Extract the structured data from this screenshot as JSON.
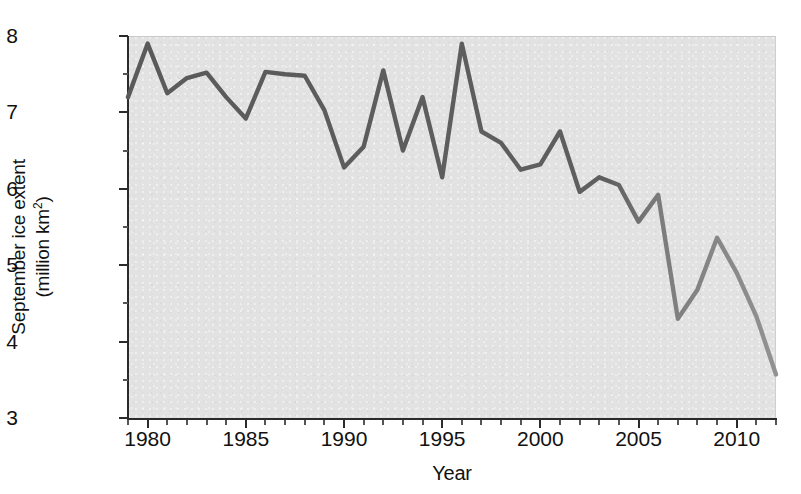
{
  "figure": {
    "background_color": "#ffffff",
    "plot_background_color": "#e2e2e2",
    "axis_color": "#2b2b2b",
    "text_color": "#111111"
  },
  "axes": {
    "y_title_line1": "September ice extent",
    "y_title_line2_prefix": "(million km",
    "y_title_line2_sup": "2",
    "y_title_line2_suffix": ")",
    "x_title": "Year",
    "y_tick_labels": [
      "8",
      "7",
      "6",
      "5",
      "4",
      "3"
    ],
    "y_tick_values": [
      8,
      7,
      6,
      5,
      4,
      3
    ],
    "y_minor_step": 0.5,
    "x_tick_labels": [
      "1980",
      "1985",
      "1990",
      "1995",
      "2000",
      "2005",
      "2010"
    ],
    "x_tick_values": [
      1980,
      1985,
      1990,
      1995,
      2000,
      2005,
      2010
    ],
    "x_minor_step": 1
  },
  "chart_data": {
    "type": "line",
    "title": "",
    "subtitle": "",
    "xlabel": "Year",
    "ylabel": "September ice extent (million km2)",
    "xlim": [
      1979,
      2012
    ],
    "ylim": [
      3,
      8
    ],
    "grid": false,
    "legend": "none",
    "line_color_early": "#5a5a5a",
    "line_color_late": "#8c8c8c",
    "line_width": 4,
    "series": [
      {
        "name": "September Arctic sea ice extent",
        "x": [
          1979,
          1980,
          1981,
          1982,
          1983,
          1984,
          1985,
          1986,
          1987,
          1988,
          1989,
          1990,
          1991,
          1992,
          1993,
          1994,
          1995,
          1996,
          1997,
          1998,
          1999,
          2000,
          2001,
          2002,
          2003,
          2004,
          2005,
          2006,
          2007,
          2008,
          2009,
          2010,
          2011,
          2012
        ],
        "values": [
          7.2,
          7.9,
          7.25,
          7.45,
          7.52,
          7.2,
          6.92,
          7.53,
          7.5,
          7.48,
          7.03,
          6.28,
          6.55,
          7.55,
          6.5,
          7.2,
          6.15,
          7.9,
          6.75,
          6.6,
          6.25,
          6.32,
          6.75,
          5.96,
          6.15,
          6.05,
          5.57,
          5.92,
          4.3,
          4.68,
          5.36,
          4.9,
          4.33,
          3.57
        ]
      }
    ],
    "annotations": []
  }
}
